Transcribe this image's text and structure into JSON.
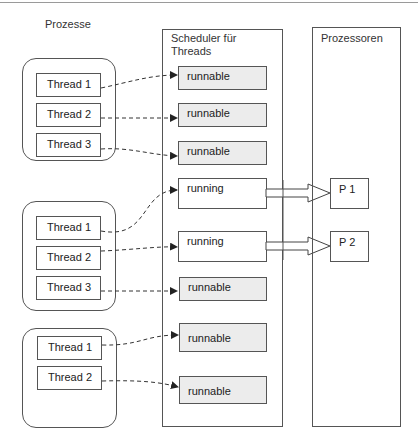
{
  "labels": {
    "processes": "Prozesse",
    "scheduler_title_line1": "Scheduler für",
    "scheduler_title_line2": "Threads",
    "processors": "Prozessoren"
  },
  "process_groups": [
    {
      "threads": [
        "Thread 1",
        "Thread 2",
        "Thread 3"
      ]
    },
    {
      "threads": [
        "Thread 1",
        "Thread 2",
        "Thread 3"
      ]
    },
    {
      "threads": [
        "Thread 1",
        "Thread 2"
      ]
    }
  ],
  "scheduler_states": [
    "runnable",
    "runnable",
    "runnable",
    "running",
    "running",
    "runnable",
    "runnable",
    "runnable"
  ],
  "processors": [
    "P 1",
    "P 2"
  ],
  "colors": {
    "line": "#555555",
    "runnable_fill": "#ececec",
    "running_fill": "#ffffff"
  }
}
